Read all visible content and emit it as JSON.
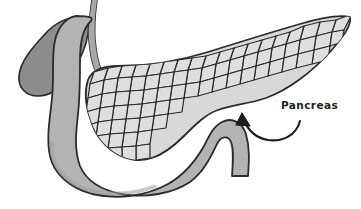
{
  "figure": {
    "background_color": "#ffffff",
    "width": 361,
    "height": 209
  },
  "palette": {
    "outline": "#2b2b2b",
    "lobule_fill": "#d8d8d8",
    "lobule_fill_light": "#e2e2e2",
    "duodenum_fill": "#b3b3b3",
    "duodenum_shade": "#9d9d9d",
    "stomach_fill": "#8d8d8d",
    "duct_fill": "#a8a8a8",
    "label_color": "#222222",
    "arrow_color": "#1d1d1d"
  },
  "annotations": {
    "label": "Pancreas",
    "label_x": 281,
    "label_y": 109,
    "arrow": {
      "name": "curved-arrow",
      "from_x": 298,
      "from_y": 120,
      "to_x": 243,
      "to_y": 117
    }
  },
  "structures": [
    {
      "name": "pancreas-tail",
      "label": "Pancreas tail",
      "fill": "#d8d8d8"
    },
    {
      "name": "pancreas-body",
      "label": "Pancreas body",
      "fill": "#d8d8d8"
    },
    {
      "name": "pancreas-head",
      "label": "Pancreas head",
      "fill": "#d8d8d8"
    },
    {
      "name": "duodenum",
      "label": "Duodenum",
      "fill": "#b3b3b3"
    },
    {
      "name": "stomach-pylorus",
      "label": "Stomach pylorus",
      "fill": "#8d8d8d"
    },
    {
      "name": "bile-duct",
      "label": "Bile duct",
      "fill": "#a8a8a8"
    }
  ]
}
